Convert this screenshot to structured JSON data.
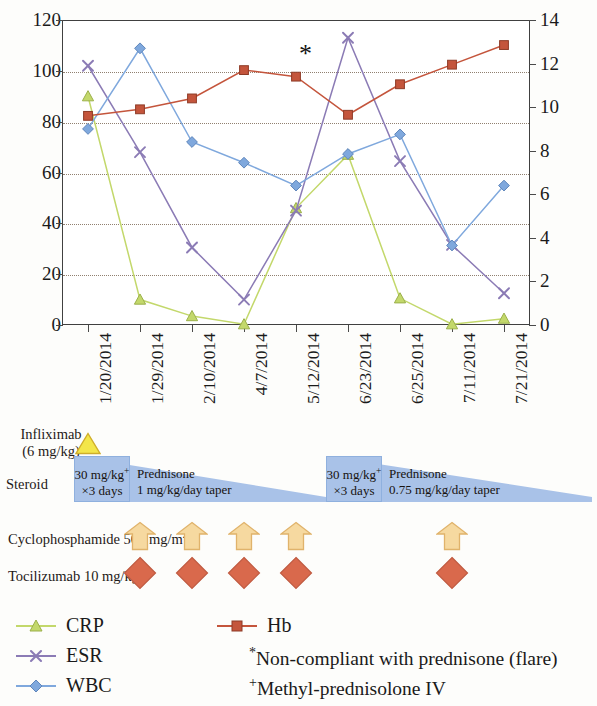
{
  "chart_data": {
    "type": "line",
    "title": "",
    "xlabel": "",
    "ylabel_left": "",
    "ylabel_right": "",
    "grid": true,
    "legend_position": "bottom",
    "categories": [
      "1/20/2014",
      "1/29/2014",
      "2/10/2014",
      "4/7/2014",
      "5/12/2014",
      "6/23/2014",
      "6/25/2014",
      "7/11/2014",
      "7/21/2014"
    ],
    "left_axis": {
      "min": 0,
      "max": 120,
      "step": 20,
      "ticks": [
        "0",
        "20",
        "40",
        "60",
        "80",
        "100",
        "120"
      ]
    },
    "right_axis": {
      "min": 0,
      "max": 14,
      "step": 2,
      "ticks": [
        "0",
        "2",
        "4",
        "6",
        "8",
        "10",
        "12",
        "14"
      ]
    },
    "series": [
      {
        "name": "CRP",
        "axis": "left",
        "color": "#c3d86b",
        "marker": "triangle",
        "values": [
          90,
          10,
          3.5,
          0.3,
          46,
          67,
          10.5,
          0.3,
          2.5
        ]
      },
      {
        "name": "ESR",
        "axis": "left",
        "color": "#8b7bb5",
        "marker": "x",
        "values": [
          102,
          68,
          30.5,
          10,
          45,
          113,
          64.5,
          31.5,
          12.5
        ]
      },
      {
        "name": "WBC",
        "axis": "right",
        "color": "#7fa8dd",
        "marker": "diamond",
        "values": [
          9.0,
          12.7,
          8.4,
          7.45,
          6.4,
          7.85,
          8.75,
          3.65,
          6.4
        ]
      },
      {
        "name": "Hb",
        "axis": "right",
        "color": "#c4553c",
        "marker": "square",
        "values": [
          9.6,
          9.9,
          10.4,
          11.7,
          11.4,
          9.65,
          11.05,
          11.95,
          12.85
        ]
      }
    ],
    "annotations": [
      {
        "name": "flare-asterisk",
        "symbol": "*",
        "at_category": "5/12/2014",
        "meaning": "Non-compliant with prednisone (flare)"
      }
    ]
  },
  "therapy": {
    "infliximab": {
      "label_line1": "Infliximab",
      "label_line2": "(6 mg/kg)",
      "marker": "triangle",
      "color": "#f3e64a",
      "at_category": "1/20/2014"
    },
    "steroid": {
      "label": "Steroid",
      "courses": [
        {
          "bolus_line1": "30 mg/kg",
          "bolus_sup": "+",
          "bolus_line2": "×3 days",
          "taper_line1": "Prednisone",
          "taper_line2": "1 mg/kg/day taper"
        },
        {
          "bolus_line1": "30 mg/kg",
          "bolus_sup": "+",
          "bolus_line2": "×3 days",
          "taper_line1": "Prednisone",
          "taper_line2": "0.75 mg/kg/day taper"
        }
      ]
    },
    "cyclophosphamide": {
      "label": "Cyclophosphamide 500 mg/m",
      "label_sup": "2",
      "marker": "arrow-up",
      "color": "#f6d9a0",
      "doses_at": [
        "1/29/2014",
        "2/10/2014",
        "4/7/2014",
        "5/12/2014",
        "7/11/2014"
      ]
    },
    "tocilizumab": {
      "label": "Tocilizumab 10 mg/kg",
      "marker": "diamond",
      "color": "#d9694c",
      "doses_at": [
        "1/29/2014",
        "2/10/2014",
        "4/7/2014",
        "5/12/2014",
        "7/11/2014"
      ]
    }
  },
  "legend": {
    "items": [
      {
        "label": "CRP",
        "color": "#c3d86b",
        "marker": "triangle"
      },
      {
        "label": "ESR",
        "color": "#8b7bb5",
        "marker": "x"
      },
      {
        "label": "WBC",
        "color": "#7fa8dd",
        "marker": "diamond"
      },
      {
        "label": "Hb",
        "color": "#c4553c",
        "marker": "square"
      }
    ],
    "notes": [
      {
        "mark": "*",
        "text": "Non-compliant with prednisone (flare)"
      },
      {
        "mark": "+",
        "text": "Methyl-prednisolone IV"
      }
    ]
  }
}
